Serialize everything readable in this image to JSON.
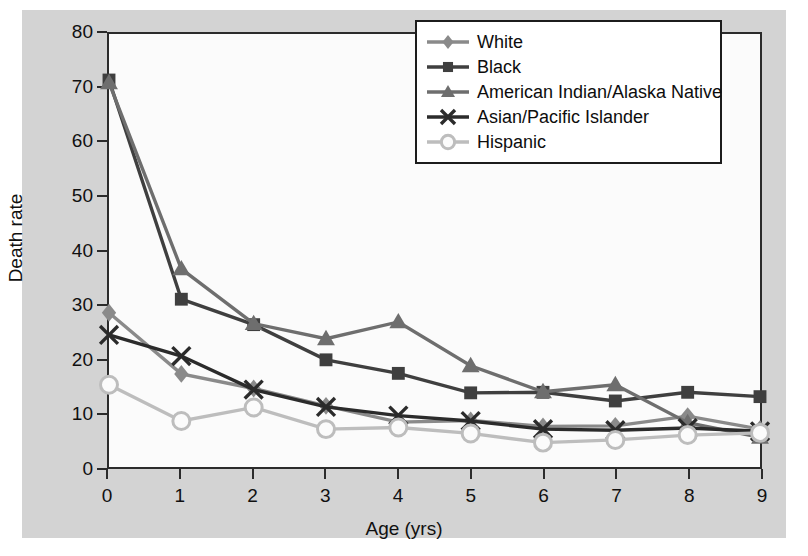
{
  "chart_data": {
    "type": "line",
    "title": "",
    "xlabel": "Age (yrs)",
    "ylabel": "Death rate",
    "x": [
      0,
      1,
      2,
      3,
      4,
      5,
      6,
      7,
      8,
      9
    ],
    "xlim": [
      0,
      9
    ],
    "ylim": [
      0,
      80
    ],
    "xticks": [
      "0",
      "1",
      "2",
      "3",
      "4",
      "5",
      "6",
      "7",
      "8",
      "9"
    ],
    "yticks": [
      "0",
      "10",
      "20",
      "30",
      "40",
      "50",
      "60",
      "70",
      "80"
    ],
    "grid": false,
    "legend_position": "upper-right",
    "series": [
      {
        "name": "White",
        "marker": "diamond",
        "color": "#8a8a8a",
        "values": [
          28.5,
          17.2,
          14.5,
          11.3,
          8.3,
          8.6,
          7.5,
          7.6,
          9.4,
          7.0
        ]
      },
      {
        "name": "Black",
        "marker": "square",
        "color": "#3f3f3f",
        "values": [
          71.5,
          31.0,
          26.3,
          19.8,
          17.3,
          13.7,
          13.8,
          12.2,
          13.8,
          13.0
        ]
      },
      {
        "name": "American Indian/Alaska Native",
        "marker": "triangle",
        "color": "#6e6e6e",
        "values": [
          71.0,
          36.6,
          26.5,
          23.7,
          26.8,
          18.7,
          13.9,
          15.2,
          8.2,
          5.5
        ]
      },
      {
        "name": "Asian/Pacific Islander",
        "marker": "x",
        "color": "#2b2b2b",
        "values": [
          24.4,
          20.5,
          14.3,
          11.1,
          9.5,
          8.5,
          7.0,
          6.8,
          7.2,
          6.6
        ]
      },
      {
        "name": "Hispanic",
        "marker": "circle-open",
        "color": "#bdbdbd",
        "values": [
          15.2,
          8.5,
          11.0,
          7.0,
          7.3,
          6.2,
          4.5,
          5.0,
          5.9,
          6.3
        ]
      }
    ]
  },
  "legend": {
    "items": [
      {
        "label": "White"
      },
      {
        "label": "Black"
      },
      {
        "label": "American Indian/Alaska Native"
      },
      {
        "label": "Asian/Pacific Islander"
      },
      {
        "label": "Hispanic"
      }
    ]
  }
}
